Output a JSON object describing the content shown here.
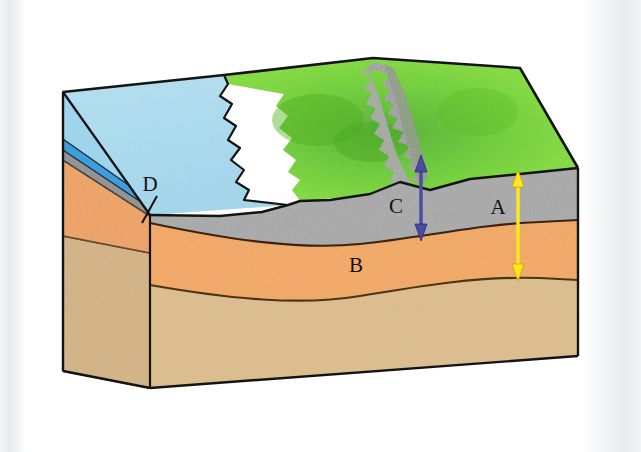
{
  "figure": {
    "type": "geologic-block-diagram",
    "width": 641,
    "height": 452,
    "background_color": "#ffffff"
  },
  "labels": [
    {
      "id": "A",
      "text": "A",
      "x": 498,
      "y": 214,
      "description": "yellow double-headed arrow spanning the gray layer and the orange layer on the right side"
    },
    {
      "id": "B",
      "text": "B",
      "x": 356,
      "y": 272,
      "description": "orange middle layer in the cut-away front face"
    },
    {
      "id": "C",
      "text": "C",
      "x": 396,
      "y": 213,
      "description": "blue-violet double-headed arrow spanning only the gray top layer"
    },
    {
      "id": "D",
      "text": "D",
      "x": 150,
      "y": 191,
      "description": "thin blue water body layer at the left, leader line points to it"
    }
  ],
  "arrows": [
    {
      "id": "C",
      "name": "c-measure-arrow",
      "color": "#4b4ba6",
      "outline_color": "#2b2b6e",
      "x": 421,
      "y_top": 158,
      "y_bottom": 238,
      "double_headed": true,
      "spans": "gray layer thickness"
    },
    {
      "id": "A",
      "name": "a-measure-arrow",
      "color": "#ffe81f",
      "outline_color": "#c9a400",
      "x": 518,
      "y_top": 172,
      "y_bottom": 278,
      "double_headed": true,
      "spans": "gray layer plus orange layer thickness"
    }
  ],
  "leader_lines": [
    {
      "id": "D",
      "name": "d-leader-line",
      "x1": 157,
      "y1": 196,
      "x2": 143,
      "y2": 222,
      "color": "#14100c"
    }
  ],
  "layers": [
    {
      "name": "water",
      "color": "#aadcf0",
      "edge_color": "#2f86c8",
      "position": "top surface, left half"
    },
    {
      "name": "vegetation",
      "color": "#76d42a",
      "shade_color": "#4fb01e",
      "position": "top surface, right half"
    },
    {
      "name": "rock-outcrop",
      "color": "#9d9d9d",
      "position": "top surface, center-right, jagged scree"
    },
    {
      "name": "gray-layer",
      "color": "#a8a8a8",
      "outline_color": "#141414",
      "position": "uppermost subsurface layer"
    },
    {
      "name": "orange-layer",
      "color": "#f4a860",
      "outline_color": "#5a3514",
      "position": "middle subsurface layer"
    },
    {
      "name": "tan-layer",
      "color": "#ddbd8c",
      "outline_color": "#4c3418",
      "position": "lowest subsurface layer"
    }
  ],
  "colors": {
    "water_top": "#aadcf0",
    "water_band": "#49a7e0",
    "vegetation": "#76d42a",
    "vegetation_dark": "#4fb01e",
    "rock_gray": "#9d9d9d",
    "gray_layer": "#a8a8a8",
    "gray_layer_side": "#9a9a9a",
    "orange_layer": "#f4a860",
    "orange_layer_side": "#efa261",
    "tan_layer": "#ddbd8c",
    "tan_layer_side": "#d4b383",
    "outline": "#141414",
    "arrow_blue": "#4b4ba6",
    "arrow_yellow": "#ffe81f",
    "label_text": "#14100c"
  }
}
